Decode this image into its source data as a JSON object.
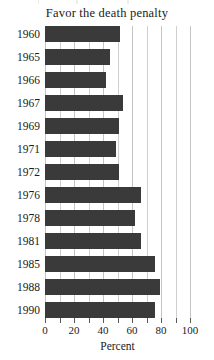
{
  "chart_data": {
    "type": "bar",
    "orientation": "horizontal",
    "title": "Favor the death penalty",
    "xlabel": "Percent",
    "ylabel": "",
    "xlim": [
      0,
      100
    ],
    "grid": true,
    "grid_interval": 10,
    "legend": false,
    "bar_color": "#3a3a3a",
    "grid_color": "#cfcfcf",
    "background": "#ffffff",
    "categories": [
      "1960",
      "1965",
      "1966",
      "1967",
      "1969",
      "1971",
      "1972",
      "1976",
      "1978",
      "1981",
      "1985",
      "1988",
      "1990"
    ],
    "values": [
      52,
      45,
      42,
      54,
      51,
      49,
      51,
      66,
      62,
      66,
      76,
      79,
      76
    ],
    "xticks": [
      0,
      10,
      20,
      30,
      40,
      50,
      60,
      70,
      80,
      90,
      100
    ],
    "xtick_labels": [
      "0",
      "",
      "20",
      "",
      "40",
      "",
      "60",
      "",
      "80",
      "",
      "100"
    ]
  }
}
